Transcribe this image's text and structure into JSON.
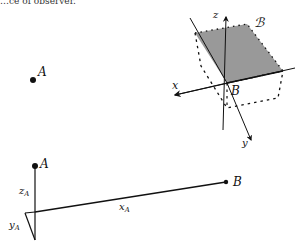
{
  "caption_fragment": "…ce of observer.",
  "panel_top_left": {
    "point_label": "A"
  },
  "panel_top_right": {
    "body_label": "ℬ",
    "origin_label": "B",
    "axes": {
      "x": "x",
      "y": "y",
      "z": "z"
    }
  },
  "panel_bottom": {
    "point_a_label": "A",
    "point_b_label": "B",
    "components": {
      "z": {
        "base": "z",
        "sub": "A"
      },
      "y": {
        "base": "y",
        "sub": "A"
      },
      "x": {
        "base": "x",
        "sub": "A"
      }
    }
  },
  "colors": {
    "plane_fill": "#999999",
    "ink": "#111111"
  }
}
